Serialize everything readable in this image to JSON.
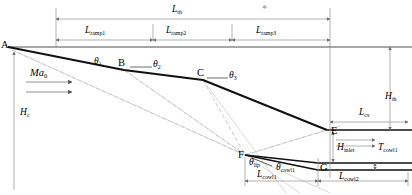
{
  "figure": {
    "type": "engineering-schematic",
    "background_color": "#ffffff",
    "line_color_main": "#1a1a1a",
    "line_color_dimension": "#8a8a8a",
    "line_color_construction": "#b0b0b0"
  },
  "points": [
    {
      "id": "A",
      "label": "A",
      "x": 8,
      "y": 47
    },
    {
      "id": "B",
      "label": "B",
      "x": 124,
      "y": 70
    },
    {
      "id": "C",
      "label": "C",
      "x": 203,
      "y": 80
    },
    {
      "id": "E",
      "label": "E",
      "x": 327,
      "y": 130
    },
    {
      "id": "F",
      "label": "F",
      "x": 245,
      "y": 155
    },
    {
      "id": "G",
      "label": "G",
      "x": 318,
      "y": 170
    }
  ],
  "dimensions": [
    {
      "id": "L_th",
      "base": "L",
      "sub": "th",
      "x": 172,
      "y": 10,
      "desc": "total inlet length"
    },
    {
      "id": "L_ramp1",
      "base": "L",
      "sub": "ramp1",
      "x": 63,
      "y": 29,
      "desc": "first ramp length"
    },
    {
      "id": "L_ramp2",
      "base": "L",
      "sub": "ramp2",
      "x": 148,
      "y": 29,
      "desc": "second ramp length"
    },
    {
      "id": "L_ramp3",
      "base": "L",
      "sub": "ramp3",
      "x": 250,
      "y": 29,
      "desc": "third ramp length"
    },
    {
      "id": "H_c",
      "base": "H",
      "sub": "c",
      "x": 16,
      "y": 112,
      "desc": "cowl height / capture height"
    },
    {
      "id": "H_th",
      "base": "H",
      "sub": "th",
      "x": 383,
      "y": 96,
      "desc": "throat height"
    },
    {
      "id": "L_cs",
      "base": "L",
      "sub": "cs",
      "x": 356,
      "y": 112,
      "desc": "cowl side length"
    },
    {
      "id": "H_inlet",
      "base": "H",
      "sub": "inlet",
      "x": 335,
      "y": 148,
      "desc": "inlet entrance height"
    },
    {
      "id": "T_cowl1",
      "base": "T",
      "sub": "cowl1",
      "x": 378,
      "y": 146,
      "desc": "cowl thickness"
    },
    {
      "id": "L_cowl1",
      "base": "L",
      "sub": "cowl1",
      "x": 242,
      "y": 173,
      "desc": "first cowl segment length"
    },
    {
      "id": "L_cowl2",
      "base": "L",
      "sub": "cowl2",
      "x": 345,
      "y": 174,
      "desc": "second cowl segment length"
    }
  ],
  "angles": [
    {
      "id": "theta1",
      "glyph": "θ",
      "sub": "1",
      "x": 98,
      "y": 62,
      "desc": "first ramp deflection angle"
    },
    {
      "id": "theta2",
      "glyph": "θ",
      "sub": "2",
      "x": 147,
      "y": 64,
      "desc": "second ramp deflection angle"
    },
    {
      "id": "theta3",
      "glyph": "θ",
      "sub": "3",
      "x": 222,
      "y": 75,
      "desc": "third ramp deflection angle"
    },
    {
      "id": "theta_lip",
      "glyph": "θ",
      "sub": "lip",
      "x": 250,
      "y": 162,
      "desc": "cowl lip angle"
    },
    {
      "id": "theta_cowl1",
      "glyph": "θ",
      "sub": "cowl1",
      "x": 281,
      "y": 166,
      "desc": "first cowl turning angle"
    }
  ],
  "flow": {
    "label_base": "Ma",
    "label_sub": "0",
    "label_x": 30,
    "label_y": 73,
    "desc": "freestream Mach number with incoming flow arrows"
  },
  "annotations": [
    {
      "id": "asterisk",
      "text": "*",
      "x": 262,
      "y": 8
    }
  ]
}
